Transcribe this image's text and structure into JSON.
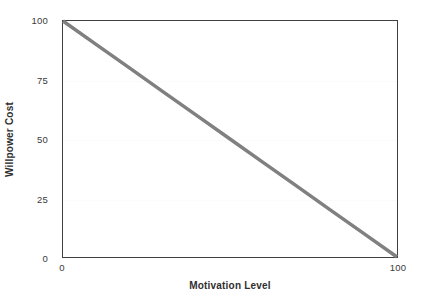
{
  "chart_data": {
    "type": "line",
    "title": "",
    "xlabel": "Motivation Level",
    "ylabel": "Willpower Cost",
    "xlim": [
      0,
      100
    ],
    "ylim": [
      0,
      100
    ],
    "xticks": [
      {
        "value": 0,
        "label": "0"
      },
      {
        "value": 100,
        "label": "100"
      }
    ],
    "yticks": [
      {
        "value": 0,
        "label": "0"
      },
      {
        "value": 25,
        "label": "25"
      },
      {
        "value": 50,
        "label": "50"
      },
      {
        "value": 75,
        "label": "75"
      },
      {
        "value": 100,
        "label": "100"
      }
    ],
    "grid": true,
    "legend": false,
    "series": [
      {
        "name": "Willpower Cost",
        "color": "#808080",
        "linewidth": 3.5,
        "x": [
          0,
          10,
          20,
          30,
          40,
          50,
          60,
          70,
          80,
          90,
          100
        ],
        "values": [
          100,
          90,
          80,
          70,
          60,
          50,
          40,
          30,
          20,
          10,
          0
        ]
      }
    ]
  },
  "style": {
    "background": "#ffffff",
    "frame_color": "#3f3f3f",
    "grid_color": "#fbfbfb",
    "tick_text_color": "#3a3a3a",
    "axis_title_color": "#2f2f2f"
  }
}
